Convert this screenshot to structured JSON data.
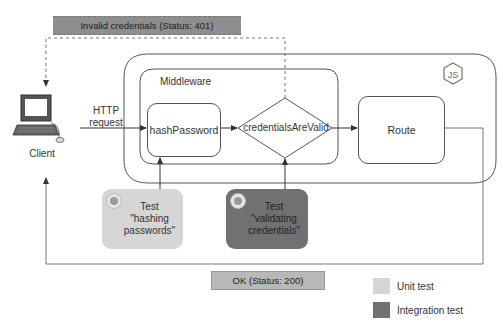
{
  "diagram": {
    "status_401": "Invalid credentials (Status: 401)",
    "status_200": "OK (Status: 200)",
    "client_label": "Client",
    "http_request_label": [
      "HTTP",
      "request"
    ],
    "middleware_label": "Middleware",
    "hash_password_label": "hashPassword",
    "credentials_label": "credentialsAreValid",
    "route_label": "Route",
    "nodejs_icon": "nodejs-logo",
    "tests": [
      {
        "line1": "Test",
        "line2": "\"hashing",
        "line3": "passwords\"",
        "type": "unit"
      },
      {
        "line1": "Test",
        "line2": "\"validating",
        "line3": "credentials\"",
        "type": "integration"
      }
    ],
    "legend": [
      {
        "label": "Unit test",
        "color": "#d6d6d6"
      },
      {
        "label": "Integration test",
        "color": "#717171"
      }
    ],
    "colors": {
      "unit": "#d6d6d6",
      "integration": "#717171",
      "status_401_bg": "#8e8e8e",
      "status_200_bg": "#b8b8b8",
      "line": "#555555"
    }
  }
}
